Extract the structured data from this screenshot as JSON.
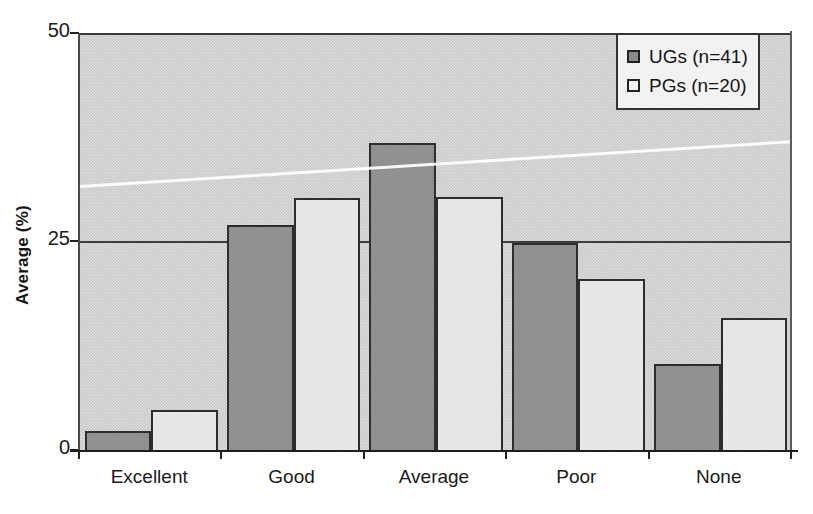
{
  "chart_data": {
    "type": "bar",
    "title": "",
    "xlabel": "",
    "ylabel": "Average (%)",
    "ylim": [
      0,
      50
    ],
    "yticks": [
      0,
      25,
      50
    ],
    "ytick_labels": [
      "0",
      "25",
      "50"
    ],
    "grid": true,
    "grid_lines": [
      25
    ],
    "legend_position": "top-right",
    "categories": [
      "Excellent",
      "Good",
      "Average",
      "Poor",
      "None"
    ],
    "series": [
      {
        "name": "UGs (n=41)",
        "short_name": "UGs",
        "n": 41,
        "color": "#8a8a8a",
        "values": [
          2.5,
          27.2,
          37.0,
          25.1,
          10.6
        ]
      },
      {
        "name": "PGs (n=20)",
        "short_name": "PGs",
        "n": 20,
        "color": "#eaeaea",
        "values": [
          5.0,
          30.5,
          30.6,
          20.8,
          16.1
        ]
      }
    ]
  },
  "axes": {
    "y_title": "Average (%)",
    "y_tick_labels": [
      "50",
      "25",
      "0"
    ],
    "x_tick_labels": [
      "Excellent",
      "Good",
      "Average",
      "Poor",
      "None"
    ]
  },
  "legend": {
    "entries": [
      {
        "label": "UGs (n=41)",
        "swatch": "dark-gray-square-icon"
      },
      {
        "label": "PGs (n=20)",
        "swatch": "light-gray-square-icon"
      }
    ]
  },
  "colors": {
    "plot_background": "#c9c9c9",
    "page_background": "#ffffff",
    "series_ug": "#8a8a8a",
    "series_pg": "#eaeaea",
    "axis": "#1d1d1d",
    "gridline": "#3d3d3d",
    "text": "#151515"
  }
}
